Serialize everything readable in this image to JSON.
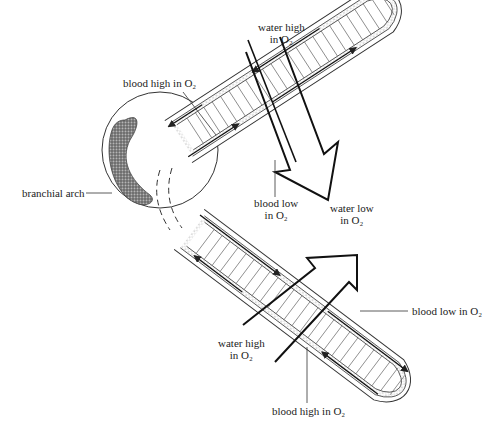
{
  "diagram": {
    "labels": {
      "water_high_top": [
        "water high",
        "in O₂"
      ],
      "blood_high_top": "blood high in O₂",
      "branchial_arch": "branchial arch",
      "blood_low_mid": [
        "blood low",
        "in O₂"
      ],
      "water_low": [
        "water low",
        "in O₂"
      ],
      "blood_low_right": "blood low in O₂",
      "water_high_bottom": [
        "water high",
        "in O₂"
      ],
      "blood_high_bottom": "blood high in O₂"
    }
  }
}
